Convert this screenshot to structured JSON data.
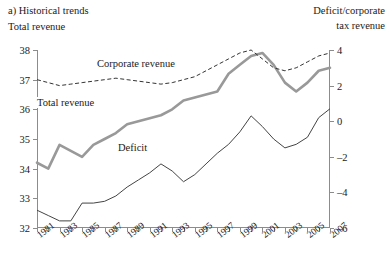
{
  "panel": {
    "label": "a) Historical trends"
  },
  "axes": {
    "left_title": "Total revenue",
    "right_title_line1": "Deficit/corporate",
    "right_title_line2": "tax revenue",
    "left_ticks": [
      38,
      37,
      36,
      35,
      34,
      33,
      32
    ],
    "right_ticks": [
      4,
      2,
      0,
      -2,
      -4,
      -6
    ],
    "x_ticks": [
      1981,
      1983,
      1985,
      1987,
      1989,
      1991,
      1993,
      1995,
      1997,
      1999,
      2001,
      2003,
      2005,
      2007
    ]
  },
  "series_labels": {
    "corporate": "Corporate revenue",
    "total": "Total revenue",
    "deficit": "Deficit"
  },
  "colors": {
    "total_revenue": "#999999",
    "corporate_revenue": "#333333",
    "deficit": "#444444",
    "axis": "#8c8c8c"
  },
  "chart_data": {
    "type": "line",
    "title": "a) Historical trends",
    "xlabel": "",
    "ylabel": "Total revenue",
    "y2label": "Deficit/corporate tax revenue",
    "xlim": [
      1981,
      2007
    ],
    "ylim": [
      32,
      38
    ],
    "y2lim": [
      -6,
      4
    ],
    "grid": false,
    "legend": "inline-annotations",
    "x": [
      1981,
      1982,
      1983,
      1984,
      1985,
      1986,
      1987,
      1988,
      1989,
      1990,
      1991,
      1992,
      1993,
      1994,
      1995,
      1996,
      1997,
      1998,
      1999,
      2000,
      2001,
      2002,
      2003,
      2004,
      2005,
      2006,
      2007
    ],
    "series": [
      {
        "name": "Total revenue",
        "axis": "left",
        "style": "solid-thick-gray",
        "values": [
          34.2,
          34.0,
          34.8,
          34.6,
          34.4,
          34.8,
          35.0,
          35.2,
          35.5,
          35.6,
          35.7,
          35.8,
          36.0,
          36.3,
          36.4,
          36.5,
          36.6,
          37.2,
          37.5,
          37.8,
          37.9,
          37.5,
          36.9,
          36.6,
          36.9,
          37.3,
          37.4
        ]
      },
      {
        "name": "Corporate revenue",
        "axis": "left",
        "style": "dashed-thin-dark",
        "values": [
          37.0,
          36.9,
          36.8,
          36.85,
          36.9,
          36.95,
          37.0,
          37.05,
          37.0,
          36.95,
          36.9,
          36.85,
          36.9,
          37.0,
          37.1,
          37.3,
          37.5,
          37.7,
          37.9,
          38.0,
          37.7,
          37.4,
          37.3,
          37.4,
          37.6,
          37.8,
          37.9
        ]
      },
      {
        "name": "Deficit",
        "axis": "right",
        "style": "solid-thin-dark",
        "values": [
          -5.0,
          -5.3,
          -5.6,
          -5.6,
          -4.6,
          -4.6,
          -4.5,
          -4.2,
          -3.7,
          -3.3,
          -2.9,
          -2.4,
          -2.8,
          -3.4,
          -3.0,
          -2.4,
          -1.8,
          -1.3,
          -0.6,
          0.3,
          -0.3,
          -1.0,
          -1.5,
          -1.3,
          -0.9,
          0.2,
          0.7
        ]
      }
    ]
  }
}
